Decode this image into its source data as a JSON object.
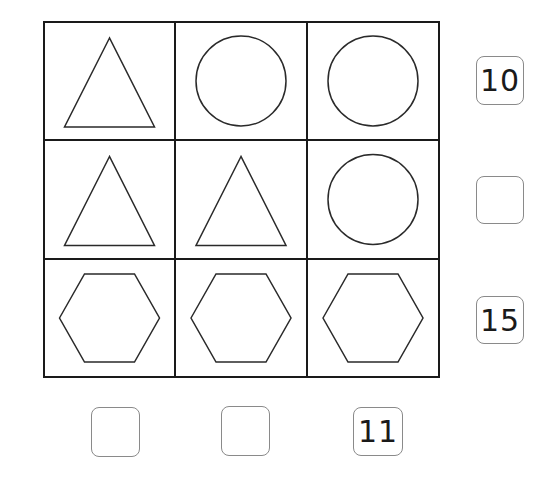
{
  "puzzle": {
    "grid": {
      "rows": 3,
      "cols": 3,
      "cells": [
        [
          "triangle",
          "circle",
          "circle"
        ],
        [
          "triangle",
          "triangle",
          "circle"
        ],
        [
          "hexagon",
          "hexagon",
          "hexagon"
        ]
      ]
    },
    "row_sums": [
      {
        "value": "10",
        "filled": true
      },
      {
        "value": "",
        "filled": false
      },
      {
        "value": "15",
        "filled": true
      }
    ],
    "col_sums": [
      {
        "value": "",
        "filled": false
      },
      {
        "value": "",
        "filled": false
      },
      {
        "value": "11",
        "filled": true
      }
    ]
  },
  "colors": {
    "grid_line": "#1a1a1a",
    "shape_stroke": "#2a2a2a",
    "box_border": "#8a8a8a",
    "background": "#ffffff"
  }
}
